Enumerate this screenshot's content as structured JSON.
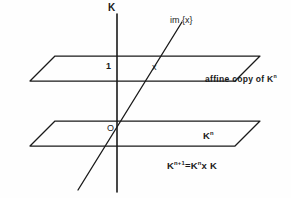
{
  "figure": {
    "background_color": "#fefefe",
    "ink_color": "#1a1a1a"
  },
  "labels": {
    "k_axis": "K",
    "im_x": "im {x}",
    "one": "1",
    "x_point": "x",
    "affine_copy_prefix": "affine copy of K",
    "affine_copy_exponent": "n",
    "origin": "O",
    "kn_base": "K",
    "kn_exponent": "n",
    "formula_k1": "K",
    "formula_exp1": "n+1",
    "formula_eq": "=",
    "formula_k2": "K",
    "formula_exp2": "n",
    "formula_times": "x",
    "formula_k3": "K"
  },
  "geometry": {
    "upper_plane": {
      "name": "affine copy of K^n",
      "points": "30,81 55,56 260,56 235,81",
      "corners": [
        [
          30,
          81
        ],
        [
          55,
          56
        ],
        [
          260,
          56
        ],
        [
          235,
          81
        ]
      ]
    },
    "lower_plane": {
      "name": "K^n",
      "points": "30,146 55,121 260,121 235,146",
      "corners": [
        [
          30,
          146
        ],
        [
          55,
          121
        ],
        [
          260,
          121
        ],
        [
          235,
          146
        ]
      ]
    },
    "k_axis_line": {
      "x1": 117,
      "y1": 14,
      "x2": 117,
      "y2": 192
    },
    "im_x_line": {
      "x1": 182,
      "y1": 22,
      "x2": 78,
      "y2": 190
    },
    "origin_point": {
      "x": 117,
      "y": 134
    },
    "x_point": {
      "x": 150,
      "y": 57
    },
    "one_point": {
      "x": 117,
      "y": 57
    }
  }
}
